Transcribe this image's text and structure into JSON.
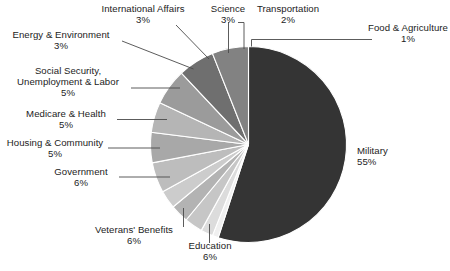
{
  "chart_data": {
    "type": "pie",
    "title": "",
    "subtitle": "",
    "xlabel": "",
    "ylabel": "",
    "legend_position": "none",
    "grid": false,
    "units": "percent",
    "categories": [
      "Military",
      "Food & Agriculture",
      "Transportation",
      "Science",
      "International Affairs",
      "Energy & Environment",
      "Social Security, Unemployment & Labor",
      "Medicare & Health",
      "Housing & Community",
      "Government",
      "Veterans' Benefits",
      "Education"
    ],
    "values": [
      55,
      1,
      2,
      3,
      3,
      3,
      5,
      5,
      5,
      6,
      6,
      6
    ],
    "slices": [
      {
        "label": "Military",
        "value": 55,
        "value_text": "55%",
        "color": "#343434"
      },
      {
        "label": "Food & Agriculture",
        "value": 1,
        "value_text": "1%",
        "color": "#f0f0f0"
      },
      {
        "label": "Transportation",
        "value": 2,
        "value_text": "2%",
        "color": "#dcdcdc"
      },
      {
        "label": "Science",
        "value": 3,
        "value_text": "3%",
        "color": "#c6c6c6"
      },
      {
        "label": "International Affairs",
        "value": 3,
        "value_text": "3%",
        "color": "#b3b3b3"
      },
      {
        "label": "Energy & Environment",
        "value": 3,
        "value_text": "3%",
        "color": "#cccccc"
      },
      {
        "label": "Social Security, Unemployment & Labor",
        "value": 5,
        "value_text": "5%",
        "color": "#bdbdbd"
      },
      {
        "label": "Medicare & Health",
        "value": 5,
        "value_text": "5%",
        "color": "#a8a8a8"
      },
      {
        "label": "Housing & Community",
        "value": 5,
        "value_text": "5%",
        "color": "#b5b5b5"
      },
      {
        "label": "Government",
        "value": 6,
        "value_text": "6%",
        "color": "#9b9b9b"
      },
      {
        "label": "Veterans' Benefits",
        "value": 6,
        "value_text": "6%",
        "color": "#6f6f6f"
      },
      {
        "label": "Education",
        "value": 6,
        "value_text": "6%",
        "color": "#828282"
      }
    ]
  },
  "labels": {
    "international_affairs": {
      "name": "International Affairs",
      "pct": "3%"
    },
    "science": {
      "name": "Science",
      "pct": "3%"
    },
    "transportation": {
      "name": "Transportation",
      "pct": "2%"
    },
    "food_agriculture": {
      "name": "Food & Agriculture",
      "pct": "1%"
    },
    "energy_environment": {
      "name": "Energy & Environment",
      "pct": "3%"
    },
    "social_security": {
      "name_line1": "Social Security,",
      "name_line2": "Unemployment & Labor",
      "pct": "5%"
    },
    "medicare_health": {
      "name": "Medicare & Health",
      "pct": "5%"
    },
    "housing_community": {
      "name": "Housing & Community",
      "pct": "5%"
    },
    "government": {
      "name": "Government",
      "pct": "6%"
    },
    "veterans_benefits": {
      "name": "Veterans' Benefits",
      "pct": "6%"
    },
    "education": {
      "name": "Education",
      "pct": "6%"
    },
    "military": {
      "name": "Military",
      "pct": "55%"
    }
  },
  "style": {
    "background": "#ffffff",
    "text_color": "#1c1c1c",
    "leader_color": "#4a4a4a",
    "slice_separator": "#ffffff"
  }
}
